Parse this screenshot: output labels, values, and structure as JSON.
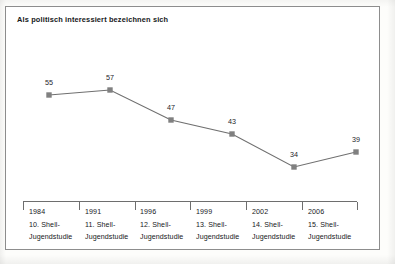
{
  "chart_data": {
    "type": "line",
    "title": "Als politisch interessiert bezeichnen sich",
    "xlabel": "",
    "ylabel": "",
    "ylim": [
      0,
      60
    ],
    "grid": false,
    "legend": "none",
    "categories": [
      "1984 10. Shell-Jugendstudie",
      "1991 11. Shell-Jugendstudie",
      "1996 12. Shell-Jugendstudie",
      "1999 13. Shell-Jugendstudie",
      "2002 14. Shell-Jugendstudie",
      "2006 15. Shell-Jugendstudie"
    ],
    "values": [
      55,
      57,
      47,
      43,
      34,
      39
    ],
    "category_lines": [
      [
        "1984",
        "10. Shell-",
        "Jugendstudie"
      ],
      [
        "1991",
        "11. Shell-",
        "Jugendstudie"
      ],
      [
        "1996",
        "12. Shell-",
        "Jugendstudie"
      ],
      [
        "1999",
        "13. Shell-",
        "Jugendstudie"
      ],
      [
        "2002",
        "14. Shell-",
        "Jugendstudie"
      ],
      [
        "2006",
        "15. Shell-",
        "Jugendstudie"
      ]
    ],
    "series": [
      {
        "name": "Politisch interessiert",
        "values": [
          55,
          57,
          47,
          43,
          34,
          39
        ]
      }
    ],
    "point_labels": [
      "55",
      "57",
      "47",
      "43",
      "34",
      "39"
    ],
    "colors": {
      "line": "#6f6f6f",
      "marker": "#808080",
      "axis": "#6e6e6e",
      "frame": "#8d8d8d",
      "text": "#16181a",
      "background": "#ffffff"
    },
    "geometry": {
      "points": [
        {
          "x": 44,
          "y": 89
        },
        {
          "x": 105,
          "y": 84
        },
        {
          "x": 166,
          "y": 114
        },
        {
          "x": 227,
          "y": 128
        },
        {
          "x": 289,
          "y": 161
        },
        {
          "x": 351,
          "y": 146
        }
      ],
      "label_offsets": [
        {
          "x": 44,
          "y": 72
        },
        {
          "x": 105,
          "y": 67
        },
        {
          "x": 166,
          "y": 97
        },
        {
          "x": 227,
          "y": 111
        },
        {
          "x": 289,
          "y": 144
        },
        {
          "x": 351,
          "y": 129
        }
      ],
      "tick_x": [
        0,
        56,
        112,
        167,
        223,
        279,
        334
      ],
      "cat_x": [
        6,
        62,
        117,
        173,
        229,
        285
      ]
    }
  }
}
